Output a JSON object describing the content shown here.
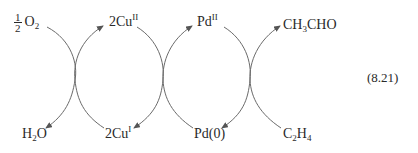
{
  "diagram": {
    "type": "coupled catalytic cycles (Wacker process)",
    "equation_number": "(8.21)",
    "top_row": [
      {
        "id": "half_o2",
        "prefix_fraction": {
          "num": "1",
          "den": "2"
        },
        "base": "O",
        "sub": "2",
        "sup": ""
      },
      {
        "id": "cu2",
        "base": "2Cu",
        "sub": "",
        "sup": "II"
      },
      {
        "id": "pd2",
        "base": "Pd",
        "sub": "",
        "sup": "II"
      },
      {
        "id": "acetaldehyde",
        "parts": [
          "CH",
          "3",
          "CHO"
        ]
      }
    ],
    "bottom_row": [
      {
        "id": "water",
        "parts": [
          "H",
          "2",
          "O"
        ]
      },
      {
        "id": "cu1",
        "base": "2Cu",
        "sub": "",
        "sup": "I"
      },
      {
        "id": "pd0",
        "base": "Pd(0)"
      },
      {
        "id": "ethylene",
        "parts": [
          "C",
          "2",
          "H",
          "4"
        ]
      }
    ],
    "arrows": [
      {
        "from": "½ O2",
        "to": "H2O"
      },
      {
        "from": "2CuI",
        "to": "2CuII"
      },
      {
        "from": "2CuII",
        "to": "2CuI"
      },
      {
        "from": "Pd(0)",
        "to": "PdII"
      },
      {
        "from": "PdII",
        "to": "Pd(0)"
      },
      {
        "from": "C2H4",
        "to": "CH3CHO"
      }
    ],
    "line_color": "#6a6a6a",
    "text_color": "#2a2a2a"
  }
}
